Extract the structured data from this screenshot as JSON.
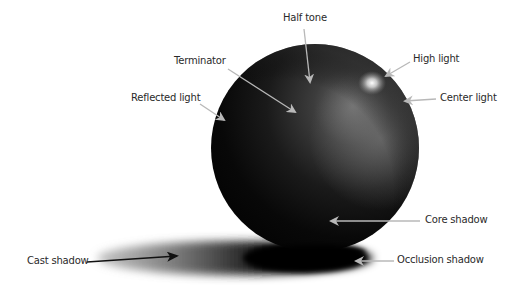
{
  "diagram": {
    "title": "",
    "colors": {
      "background": "#ffffff",
      "sphere_dark": "#0b0b0b",
      "sphere_mid": "#3a3a3a",
      "highlight": "#ffffff",
      "arrow_gray": "#b8b8b8",
      "arrow_black": "#111111",
      "label_text": "#2a2a2a"
    },
    "labels": [
      {
        "id": "half-tone",
        "text": "Half tone",
        "x": 283,
        "y": 12
      },
      {
        "id": "terminator",
        "text": "Terminator",
        "x": 174,
        "y": 55
      },
      {
        "id": "reflected-light",
        "text": "Reflected light",
        "x": 131,
        "y": 92
      },
      {
        "id": "high-light",
        "text": "High light",
        "x": 413,
        "y": 53
      },
      {
        "id": "center-light",
        "text": "Center light",
        "x": 440,
        "y": 92
      },
      {
        "id": "core-shadow",
        "text": "Core shadow",
        "x": 425,
        "y": 214
      },
      {
        "id": "occlusion-shadow",
        "text": "Occlusion shadow",
        "x": 397,
        "y": 254
      },
      {
        "id": "cast-shadow",
        "text": "Cast shadow",
        "x": 27,
        "y": 255
      }
    ]
  }
}
